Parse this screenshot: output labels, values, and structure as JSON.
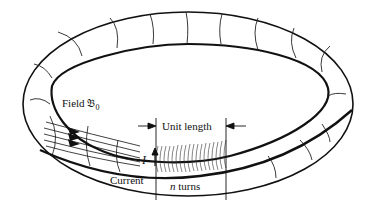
{
  "diagram": {
    "labels": {
      "field": "Field ",
      "field_symbol": "𝔅",
      "field_subscript": "0",
      "unit_length": "Unit length",
      "current_symbol": "I",
      "current": "Current",
      "turns_var": "n",
      "turns": " turns"
    },
    "colors": {
      "stroke": "#111111",
      "background": "#ffffff"
    }
  }
}
